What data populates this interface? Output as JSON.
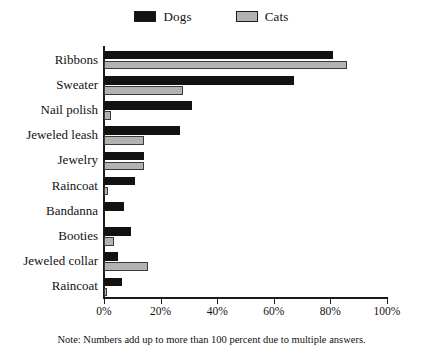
{
  "chart_data": {
    "type": "bar",
    "orientation": "horizontal",
    "title": "",
    "xlabel": "",
    "ylabel": "",
    "xlim": [
      0,
      100
    ],
    "grid": false,
    "legend_position": "top-center",
    "xtick_labels": [
      "0%",
      "20%",
      "40%",
      "60%",
      "80%",
      "100%"
    ],
    "xtick_values": [
      0,
      20,
      40,
      60,
      80,
      100
    ],
    "categories": [
      "Ribbons",
      "Sweater",
      "Nail polish",
      "Jeweled leash",
      "Jewelry",
      "Raincoat",
      "Bandanna",
      "Booties",
      "Jeweled collar",
      "Raincoat"
    ],
    "series": [
      {
        "name": "Dogs",
        "color": "#121212",
        "values": [
          81,
          67,
          31,
          27,
          14,
          11,
          7,
          9.5,
          5,
          6.5
        ]
      },
      {
        "name": "Cats",
        "color": "#b2b2b2",
        "values": [
          86,
          28,
          2.5,
          14,
          14,
          1.5,
          0,
          3.5,
          15.5,
          1
        ]
      }
    ],
    "annotations": [
      "Note: Numbers add up to more than 100 percent due to multiple answers."
    ]
  },
  "legend": {
    "entries": [
      {
        "label": "Dogs",
        "color": "#121212"
      },
      {
        "label": "Cats",
        "color": "#b2b2b2"
      }
    ]
  },
  "footnote": {
    "text": "Note: Numbers add up to more than 100 percent due to multiple answers."
  }
}
